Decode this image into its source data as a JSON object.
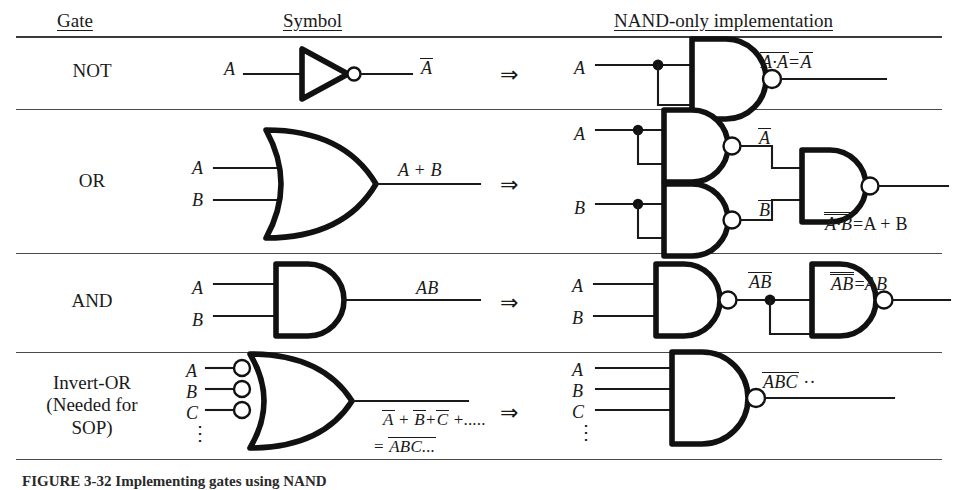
{
  "figure": {
    "caption": "FIGURE 3-32   Implementing gates using NAND"
  },
  "table": {
    "headers": [
      {
        "key": "gate",
        "label": "Gate"
      },
      {
        "key": "symbol",
        "label": "Symbol"
      },
      {
        "key": "nand",
        "label": "NAND-only  implementation"
      }
    ],
    "implies_arrow": "⇒",
    "rows": [
      {
        "gate_label": "NOT",
        "symbol": {
          "gate_type": "not",
          "inputs": [
            "A"
          ],
          "output_label": "A̅"
        },
        "nand": {
          "gate_type": "nand-tied-input",
          "inputs": [
            "A"
          ],
          "output_label": "A·A = A̅",
          "output_parts": {
            "left": "A·A",
            "eq": "=",
            "right": "A"
          }
        }
      },
      {
        "gate_label": "OR",
        "symbol": {
          "gate_type": "or",
          "inputs": [
            "A",
            "B"
          ],
          "output_label": "A + B"
        },
        "nand": {
          "gate_type": "three-nand-or",
          "inputs": [
            "A",
            "B"
          ],
          "intermediate_labels": [
            "A̅",
            "B̅"
          ],
          "output_parts": {
            "left": "A·B",
            "eq": "=",
            "right": "A + B"
          }
        }
      },
      {
        "gate_label": "AND",
        "symbol": {
          "gate_type": "and",
          "inputs": [
            "A",
            "B"
          ],
          "output_label": "AB"
        },
        "nand": {
          "gate_type": "two-nand-and",
          "inputs": [
            "A",
            "B"
          ],
          "intermediate_labels": [
            "AB"
          ],
          "output_parts": {
            "left": "AB",
            "eq": "=",
            "right": "AB"
          }
        }
      },
      {
        "gate_label": "Invert-OR\n(Needed for\nSOP)",
        "symbol": {
          "gate_type": "or-with-inverted-inputs",
          "inputs": [
            "A",
            "B",
            "C"
          ],
          "input_continuation": "⋮",
          "output_line_1": "A + B + C + .....",
          "output_line_2": "= ABC..."
        },
        "nand": {
          "gate_type": "nand3",
          "inputs": [
            "A",
            "B",
            "C"
          ],
          "input_continuation": "⋮",
          "output_label": "ABC ··"
        }
      }
    ]
  }
}
